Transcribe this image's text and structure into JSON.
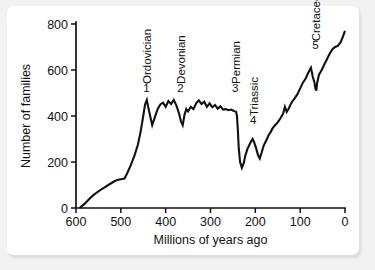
{
  "figure": {
    "background_color": "#f2f2f2",
    "panel_color": "#ffffff",
    "line_color": "#111111"
  },
  "chart_data": {
    "type": "line",
    "title": "",
    "xlabel": "Millions of years ago",
    "ylabel": "Number of families",
    "xlim": [
      600,
      0
    ],
    "ylim": [
      0,
      800
    ],
    "x_axis_reversed": true,
    "grid": false,
    "legend": "none",
    "xticks": [
      600,
      500,
      400,
      300,
      200,
      100,
      0
    ],
    "xtick_labels": [
      "600",
      "500",
      "400",
      "300",
      "200",
      "100",
      "0"
    ],
    "yticks": [
      0,
      200,
      400,
      600,
      800
    ],
    "ytick_labels": [
      "0",
      "200",
      "400",
      "600",
      "800"
    ],
    "series": [
      {
        "name": "Number of families",
        "x": [
          592,
          580,
          570,
          560,
          548,
          538,
          528,
          518,
          508,
          500,
          492,
          486,
          478,
          470,
          462,
          456,
          450,
          446,
          442,
          438,
          434,
          430,
          424,
          418,
          412,
          406,
          400,
          394,
          388,
          382,
          376,
          370,
          366,
          362,
          358,
          354,
          350,
          344,
          338,
          332,
          326,
          320,
          314,
          308,
          302,
          296,
          290,
          284,
          278,
          272,
          266,
          260,
          254,
          250,
          246,
          243,
          241,
          239,
          237,
          234,
          230,
          226,
          222,
          218,
          214,
          210,
          206,
          202,
          198,
          194,
          190,
          186,
          182,
          178,
          174,
          170,
          166,
          162,
          156,
          150,
          144,
          138,
          134,
          130,
          126,
          122,
          118,
          112,
          106,
          100,
          94,
          88,
          82,
          76,
          72,
          68,
          66,
          64,
          62,
          58,
          52,
          46,
          40,
          34,
          28,
          22,
          16,
          10,
          4,
          0
        ],
        "y": [
          0,
          20,
          40,
          58,
          75,
          88,
          100,
          112,
          122,
          125,
          128,
          150,
          185,
          225,
          275,
          330,
          400,
          450,
          470,
          430,
          395,
          360,
          395,
          430,
          450,
          458,
          440,
          465,
          452,
          470,
          445,
          410,
          378,
          360,
          405,
          430,
          420,
          440,
          430,
          455,
          468,
          452,
          462,
          440,
          455,
          438,
          448,
          432,
          442,
          428,
          430,
          425,
          428,
          424,
          420,
          418,
          400,
          340,
          260,
          200,
          175,
          195,
          230,
          255,
          272,
          288,
          300,
          282,
          258,
          230,
          215,
          240,
          268,
          285,
          300,
          318,
          330,
          345,
          360,
          372,
          390,
          410,
          440,
          418,
          430,
          448,
          462,
          478,
          495,
          520,
          545,
          562,
          588,
          610,
          572,
          545,
          520,
          510,
          545,
          580,
          600,
          625,
          648,
          672,
          690,
          700,
          705,
          720,
          748,
          770
        ]
      }
    ],
    "annotations": [
      {
        "id": "1",
        "number": "1",
        "name": "Ordovician",
        "x_ma": 443,
        "y_families": 470
      },
      {
        "id": "2",
        "number": "2",
        "name": "Devonian",
        "x_ma": 367,
        "y_families": 470
      },
      {
        "id": "3",
        "number": "3",
        "name": "Permian",
        "x_ma": 245,
        "y_families": 470
      },
      {
        "id": "4",
        "number": "4",
        "name": "Triassic",
        "x_ma": 205,
        "y_families": 330
      },
      {
        "id": "5",
        "number": "5",
        "name": "Cretaceous",
        "x_ma": 66,
        "y_families": 655
      }
    ]
  }
}
